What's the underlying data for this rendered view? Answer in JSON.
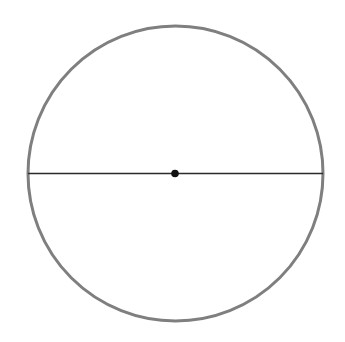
{
  "diagram": {
    "canvas": {
      "width": 345,
      "height": 342,
      "background": "#ffffff"
    },
    "circle": {
      "cx": 175.5,
      "cy": 173.5,
      "r": 147.5,
      "stroke": "#7f7f7f",
      "stroke_width": 3
    },
    "diameter": {
      "x1": 28,
      "y1": 173.5,
      "x2": 323,
      "y2": 173.5,
      "stroke": "#2b2b2b",
      "stroke_width": 1.6
    },
    "center_point": {
      "cx": 175,
      "cy": 173.5,
      "r": 3.8,
      "fill": "#111111"
    }
  }
}
